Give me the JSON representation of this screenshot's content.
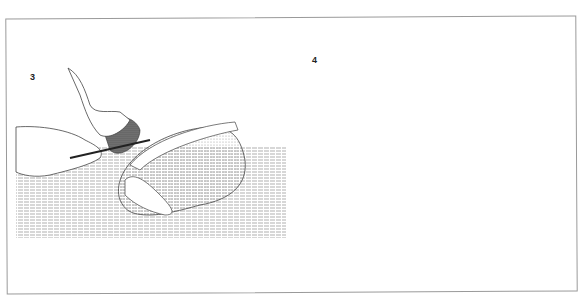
{
  "figure": {
    "panels": [
      {
        "number": "3",
        "description": "Hands holding knife cutting into a poultry carcass on a hatched table surface"
      },
      {
        "number": "4",
        "description": "Hands pulling apart skin with string from opened poultry carcass on a hatched table surface"
      }
    ]
  }
}
